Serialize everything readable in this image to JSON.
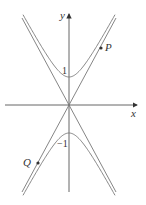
{
  "diagram": {
    "type": "hyperbola-with-asymptotes",
    "labels": {
      "x_axis": "x",
      "y_axis": "y",
      "point_p": "P",
      "point_q": "Q",
      "tick_pos": "1",
      "tick_neg": "−1"
    },
    "colors": {
      "axes": "#555555",
      "curve": "#777777",
      "asymptote": "#777777",
      "point": "#333333"
    }
  }
}
